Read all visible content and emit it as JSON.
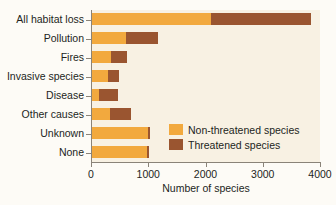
{
  "chart_data": {
    "type": "bar",
    "orientation": "horizontal",
    "stacked": true,
    "title": "",
    "xlabel": "Number of species",
    "ylabel": "",
    "xlim": [
      0,
      4000
    ],
    "xticks": [
      0,
      1000,
      2000,
      3000,
      4000
    ],
    "xtick_labels": [
      "0",
      "1000",
      "2000",
      "3000",
      "4000"
    ],
    "grid": false,
    "legend_position": "inside-lower-right",
    "categories": [
      "All habitat loss",
      "Pollution",
      "Fires",
      "Invasive species",
      "Disease",
      "Other causes",
      "Unknown",
      "None"
    ],
    "series": [
      {
        "name": "Non-threatened species",
        "color": "#f2a93e",
        "values": [
          2100,
          610,
          350,
          300,
          140,
          330,
          990,
          985
        ]
      },
      {
        "name": "Threatened species",
        "color": "#9a5530",
        "values": [
          1750,
          560,
          280,
          190,
          330,
          370,
          45,
          25
        ]
      }
    ],
    "totals": [
      3850,
      1170,
      630,
      490,
      470,
      700,
      1035,
      1010
    ]
  },
  "legend": {
    "items": [
      {
        "label": "Non-threatened species",
        "color": "#f2a93e"
      },
      {
        "label": "Threatened species",
        "color": "#9a5530"
      }
    ]
  },
  "colors": {
    "non_threatened": "#f2a93e",
    "threatened": "#9a5530",
    "plot_background": "#f8f1e3",
    "page_background": "#fdfbf6",
    "axis": "#8a8378",
    "text": "#231f1c"
  }
}
